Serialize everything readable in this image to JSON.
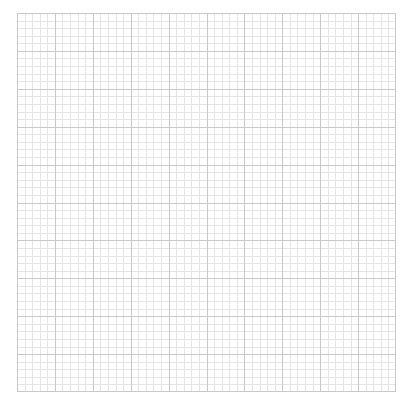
{
  "graph_paper": {
    "origin_x": 17,
    "origin_y": 13,
    "width": 379,
    "height": 379,
    "major_divisions_x": 10,
    "major_divisions_y": 10,
    "minor_per_major": 5,
    "colors": {
      "background": "#ffffff",
      "major_line": "#c8c8c8",
      "minor_line": "#e4e4e4",
      "border": "#c8c8c8"
    }
  }
}
